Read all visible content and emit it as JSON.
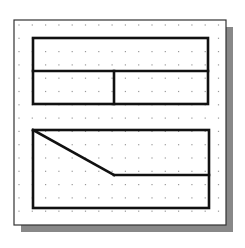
{
  "diagram": {
    "type": "grid-sketch",
    "colors": {
      "background": "#ffffff",
      "frame_border": "#333333",
      "shadow": "#888888",
      "grid_dot": "#9a9a9a",
      "stroke": "#111111"
    },
    "frame": {
      "x": 14,
      "y": 20,
      "w": 212,
      "h": 205,
      "shadow_offset": 7
    },
    "grid": {
      "x0": 19,
      "y0": 25,
      "step": 13.3,
      "cols": 16,
      "rows": 16
    },
    "shapes": [
      {
        "name": "top-block",
        "outline": {
          "x": 33,
          "y": 38,
          "w": 175,
          "h": 66
        },
        "lines": [
          {
            "name": "horizontal-divider",
            "x1": 33,
            "y1": 71,
            "x2": 208,
            "y2": 71
          },
          {
            "name": "vertical-divider",
            "x1": 114,
            "y1": 71,
            "x2": 114,
            "y2": 104
          }
        ]
      },
      {
        "name": "bottom-block",
        "outline": {
          "x": 33,
          "y": 130,
          "w": 176,
          "h": 78
        },
        "lines": [
          {
            "name": "diagonal-line",
            "x1": 33,
            "y1": 130,
            "x2": 114,
            "y2": 175
          },
          {
            "name": "horizontal-step-line",
            "x1": 114,
            "y1": 175,
            "x2": 209,
            "y2": 175
          }
        ]
      }
    ]
  }
}
